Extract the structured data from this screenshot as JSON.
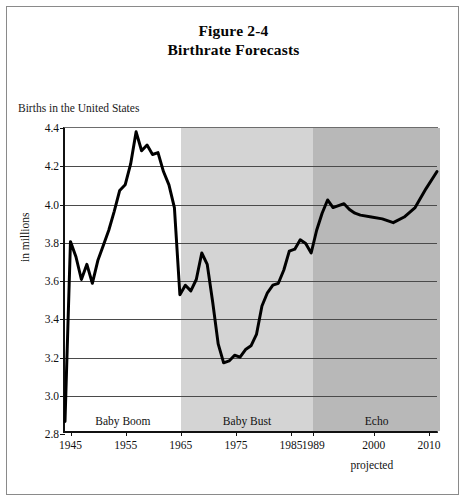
{
  "figure": {
    "title_line_1": "Figure 2-4",
    "title_line_2": "Birthrate Forecasts",
    "axis_note": "Births in the United States",
    "projected_note": "projected"
  },
  "colors": {
    "frame": "#8a8a8a",
    "axis": "#111111",
    "gridline": "#4a4a4a",
    "line": "#000000",
    "band_baby_boom": "#ffffff",
    "band_baby_bust": "#d4d4d4",
    "band_echo": "#b8b8b8"
  },
  "chart_data": {
    "type": "line",
    "title": "Figure 2-4 Birthrate Forecasts",
    "subtitle": "Births in the United States",
    "xlabel": "",
    "ylabel": "in millions",
    "xlim": [
      1944,
      2012
    ],
    "ylim": [
      2.8,
      4.4
    ],
    "grid": true,
    "legend_position": "none",
    "ytick_labels": [
      "2.8",
      "3.0",
      "3.2",
      "3.4",
      "3.6",
      "3.8",
      "4.0",
      "4.2",
      "4.4"
    ],
    "ytick_values": [
      2.8,
      3.0,
      3.2,
      3.4,
      3.6,
      3.8,
      4.0,
      4.2,
      4.4
    ],
    "xtick_labels": [
      "1945",
      "1955",
      "1965",
      "1975",
      "1985",
      "1989",
      "2000",
      "2010"
    ],
    "xtick_values": [
      1945,
      1955,
      1965,
      1975,
      1985,
      1989,
      2000,
      2010
    ],
    "bands": [
      {
        "label": "Baby Boom",
        "start": 1944,
        "end": 1965,
        "fill": "#ffffff"
      },
      {
        "label": "Baby Bust",
        "start": 1965,
        "end": 1989,
        "fill": "#d4d4d4"
      },
      {
        "label": "Echo",
        "start": 1989,
        "end": 2012,
        "fill": "#b8b8b8"
      }
    ],
    "annotations": [
      {
        "text": "projected",
        "x": 2000,
        "position": "below-axis"
      }
    ],
    "series": [
      {
        "name": "Births in the United States",
        "x": [
          1944,
          1945,
          1946,
          1947,
          1948,
          1949,
          1950,
          1951,
          1952,
          1953,
          1954,
          1955,
          1956,
          1957,
          1958,
          1959,
          1960,
          1961,
          1962,
          1963,
          1964,
          1965,
          1966,
          1967,
          1968,
          1969,
          1970,
          1971,
          1972,
          1973,
          1974,
          1975,
          1976,
          1977,
          1978,
          1979,
          1980,
          1981,
          1982,
          1983,
          1984,
          1985,
          1986,
          1987,
          1988,
          1989,
          1990,
          1991,
          1992,
          1993,
          1994,
          1995,
          1996,
          1997,
          1998,
          2000,
          2002,
          2004,
          2006,
          2008,
          2010,
          2012
        ],
        "y": [
          2.85,
          3.8,
          3.72,
          3.6,
          3.68,
          3.58,
          3.7,
          3.78,
          3.86,
          3.96,
          4.07,
          4.1,
          4.21,
          4.38,
          4.28,
          4.31,
          4.26,
          4.27,
          4.17,
          4.1,
          3.98,
          3.52,
          3.57,
          3.54,
          3.6,
          3.74,
          3.68,
          3.48,
          3.26,
          3.16,
          3.17,
          3.2,
          3.19,
          3.23,
          3.25,
          3.31,
          3.46,
          3.53,
          3.57,
          3.58,
          3.65,
          3.75,
          3.76,
          3.81,
          3.79,
          3.74,
          3.86,
          3.95,
          4.02,
          3.98,
          3.99,
          4.0,
          3.97,
          3.95,
          3.94,
          3.93,
          3.92,
          3.9,
          3.93,
          3.98,
          4.08,
          4.17
        ]
      }
    ]
  }
}
